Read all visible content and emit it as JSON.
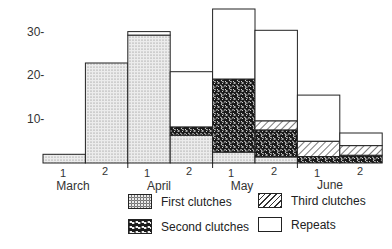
{
  "chart_data": {
    "type": "bar",
    "stacked": true,
    "title": "",
    "xlabel": "",
    "ylabel": "",
    "ylim": [
      0,
      36
    ],
    "yticks": [
      10,
      20,
      30
    ],
    "ytick_labels": [
      "10-",
      "20-",
      "30-"
    ],
    "grid": false,
    "legend_position": "bottom-right",
    "categories": [
      "March 1",
      "March 2",
      "April 1",
      "April 2",
      "May 1",
      "May 2",
      "June 1",
      "June 2"
    ],
    "period_labels": [
      "1",
      "2",
      "1",
      "2",
      "1",
      "2",
      "1",
      "2"
    ],
    "months": [
      "March",
      "April",
      "May",
      "June"
    ],
    "series": [
      {
        "name": "First clutches",
        "pattern": "stipple",
        "values": [
          2,
          23,
          29.4,
          6.4,
          2.5,
          1.4,
          0,
          0
        ]
      },
      {
        "name": "Second clutches",
        "pattern": "mottled",
        "values": [
          0,
          0,
          0,
          1.9,
          16.8,
          6.2,
          1.5,
          1.8
        ]
      },
      {
        "name": "Third clutches",
        "pattern": "hatched",
        "values": [
          0,
          0,
          0,
          0,
          0,
          2.1,
          3.5,
          2.2
        ]
      },
      {
        "name": "Repeats",
        "pattern": "blank",
        "values": [
          0,
          0,
          0.8,
          12.7,
          16.1,
          20.8,
          10.6,
          2.9
        ]
      }
    ],
    "totals": [
      2,
      23,
      30.2,
      21,
      35.4,
      30.5,
      15.6,
      6.9
    ]
  },
  "legend": [
    {
      "label": "First clutches"
    },
    {
      "label": "Second clutches"
    },
    {
      "label": "Third clutches"
    },
    {
      "label": "Repeats"
    }
  ]
}
